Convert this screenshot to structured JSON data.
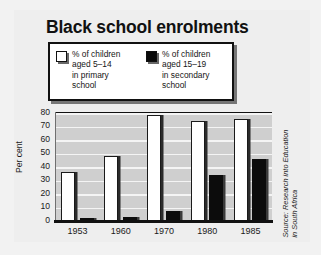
{
  "chart_data": {
    "type": "bar",
    "title": "Black school enrolments",
    "xlabel": "",
    "ylabel": "Per cent",
    "categories": [
      "1953",
      "1960",
      "1970",
      "1980",
      "1985"
    ],
    "ylim": [
      0,
      80
    ],
    "yticks": [
      "0",
      "10",
      "20",
      "30",
      "40",
      "50",
      "60",
      "70",
      "80"
    ],
    "grid": true,
    "legend_position": "top",
    "series": [
      {
        "name": "% of children aged 5–14 in primary school",
        "legend_line1": "% of children",
        "legend_line2": "aged 5–14",
        "legend_line3": "in primary",
        "legend_line4": "school",
        "color": "#ffffff",
        "values": [
          37,
          49,
          79,
          75,
          76
        ]
      },
      {
        "name": "% of children aged 15–19 in secondary school",
        "legend_line1": "% of children",
        "legend_line2": "aged 15–19",
        "legend_line3": "in secondary",
        "legend_line4": "school",
        "color": "#0c0c0c",
        "values": [
          3,
          4,
          8,
          35,
          47
        ]
      }
    ],
    "annotations": {
      "source": "Source: Research into Education\nin South Africa"
    }
  },
  "colors": {
    "page_background": "#f2f2f2",
    "panel_background": "#eeeeee",
    "plot_background": "#cfcfcf",
    "gridline": "#f4f4f4",
    "ink": "#111111",
    "primary_bar": "#ffffff",
    "secondary_bar": "#0c0c0c"
  }
}
